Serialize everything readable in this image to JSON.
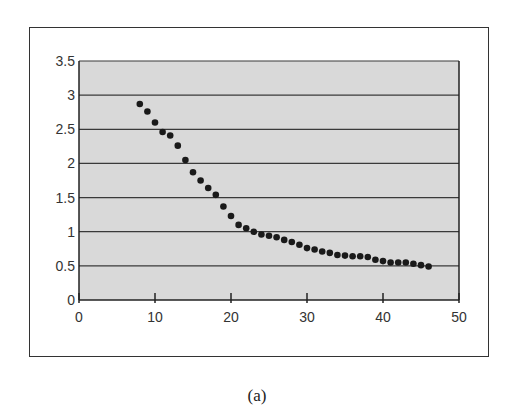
{
  "chart_data": {
    "type": "scatter",
    "title": "",
    "xlabel": "",
    "ylabel": "",
    "xlim": [
      0,
      50
    ],
    "ylim": [
      0,
      3.5
    ],
    "xticks": [
      0,
      10,
      20,
      30,
      40,
      50
    ],
    "yticks": [
      0,
      0.5,
      1,
      1.5,
      2,
      2.5,
      3,
      3.5
    ],
    "xtick_labels": [
      "0",
      "10",
      "20",
      "30",
      "40",
      "50"
    ],
    "ytick_labels": [
      "0",
      "0.5",
      "1",
      "1.5",
      "2",
      "2.5",
      "3",
      "3.5"
    ],
    "grid": "horizontal",
    "legend": null,
    "plot_background": "#d9d9d9",
    "marker_color": "#1a1a1a",
    "x": [
      8,
      9,
      10,
      11,
      12,
      13,
      14,
      15,
      16,
      17,
      18,
      19,
      20,
      21,
      22,
      23,
      24,
      25,
      26,
      27,
      28,
      29,
      30,
      31,
      32,
      33,
      34,
      35,
      36,
      37,
      38,
      39,
      40,
      41,
      42,
      43,
      44,
      45,
      46
    ],
    "y": [
      2.87,
      2.76,
      2.6,
      2.46,
      2.41,
      2.26,
      2.05,
      1.87,
      1.75,
      1.64,
      1.54,
      1.37,
      1.23,
      1.1,
      1.05,
      1.0,
      0.96,
      0.94,
      0.92,
      0.88,
      0.85,
      0.81,
      0.76,
      0.74,
      0.71,
      0.69,
      0.66,
      0.65,
      0.64,
      0.64,
      0.63,
      0.59,
      0.57,
      0.55,
      0.55,
      0.55,
      0.53,
      0.51,
      0.49
    ]
  },
  "caption": "(a)"
}
